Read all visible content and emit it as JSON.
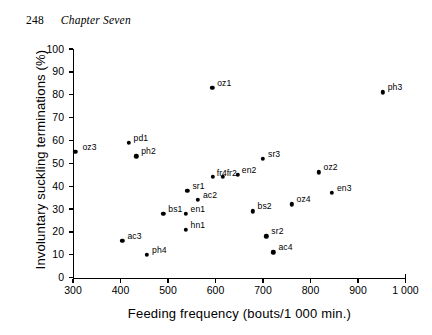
{
  "page": {
    "folio": "248",
    "chapter": "Chapter Seven"
  },
  "chart_data": {
    "type": "scatter",
    "title": "",
    "xlabel": "Feeding frequency  (bouts/1 000 min.)",
    "ylabel": "Involuntary suckling terminations (%)",
    "xlim": [
      300,
      1000
    ],
    "ylim": [
      0,
      100
    ],
    "xticks": [
      300,
      400,
      500,
      600,
      700,
      800,
      900,
      1000
    ],
    "xtick_labels": [
      "300",
      "400",
      "500",
      "600",
      "700",
      "800",
      "900",
      "1 000"
    ],
    "yticks": [
      0,
      10,
      20,
      30,
      40,
      50,
      60,
      70,
      80,
      90,
      100
    ],
    "ytick_labels": [
      "0",
      "10",
      "20",
      "30",
      "40",
      "50",
      "60",
      "70",
      "80",
      "90",
      "100"
    ],
    "grid": false,
    "legend": "none",
    "marker": "filled-circle",
    "marker_color": "#000000",
    "points": [
      {
        "label": "oz3",
        "x": 305,
        "y": 55,
        "lx": 7,
        "ly": -9
      },
      {
        "label": "pd1",
        "x": 417,
        "y": 59,
        "lx": 5,
        "ly": -9
      },
      {
        "label": "ph2",
        "x": 433,
        "y": 53,
        "lx": 5,
        "ly": -9
      },
      {
        "label": "ac3",
        "x": 404,
        "y": 16,
        "lx": 5,
        "ly": -9
      },
      {
        "label": "ph4",
        "x": 456,
        "y": 10,
        "lx": 5,
        "ly": -9
      },
      {
        "label": "bs1",
        "x": 490,
        "y": 28,
        "lx": 5,
        "ly": -9
      },
      {
        "label": "en1",
        "x": 537,
        "y": 28,
        "lx": 5,
        "ly": -9
      },
      {
        "label": "hn1",
        "x": 537,
        "y": 21,
        "lx": 5,
        "ly": -9
      },
      {
        "label": "sr1",
        "x": 541,
        "y": 38,
        "lx": 5,
        "ly": -9
      },
      {
        "label": "ac2",
        "x": 563,
        "y": 34,
        "lx": 5,
        "ly": -9
      },
      {
        "label": "oz1",
        "x": 593,
        "y": 83,
        "lx": 5,
        "ly": -9
      },
      {
        "label": "fr4",
        "x": 594,
        "y": 44,
        "lx": 4,
        "ly": -8
      },
      {
        "label": "fr2",
        "x": 615,
        "y": 44,
        "lx": 4,
        "ly": -8
      },
      {
        "label": "en2",
        "x": 647,
        "y": 45,
        "lx": 4,
        "ly": -9
      },
      {
        "label": "sr2",
        "x": 707,
        "y": 18,
        "lx": 5,
        "ly": -9
      },
      {
        "label": "ac4",
        "x": 722,
        "y": 11,
        "lx": 5,
        "ly": -9
      },
      {
        "label": "bs2",
        "x": 678,
        "y": 29,
        "lx": 5,
        "ly": -9
      },
      {
        "label": "sr3",
        "x": 700,
        "y": 52,
        "lx": 5,
        "ly": -9
      },
      {
        "label": "oz4",
        "x": 760,
        "y": 32,
        "lx": 5,
        "ly": -9
      },
      {
        "label": "oz2",
        "x": 817,
        "y": 46,
        "lx": 5,
        "ly": -9
      },
      {
        "label": "en3",
        "x": 845,
        "y": 37,
        "lx": 5,
        "ly": -9
      },
      {
        "label": "ph3",
        "x": 952,
        "y": 81,
        "lx": 5,
        "ly": -9
      }
    ]
  }
}
